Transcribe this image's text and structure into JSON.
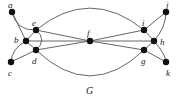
{
  "figure": {
    "caption": "G",
    "caption_position": {
      "x": 86,
      "y": 86
    },
    "width": 179,
    "height": 103,
    "background_color": "#ffffff",
    "edge_color": "#555555",
    "vertex_color": "#111111",
    "label_color": "#1a1a1a"
  },
  "graph": {
    "name": "G",
    "vertex_count": 11,
    "edge_count": 18,
    "vertices": [
      {
        "id": "a",
        "label": "a",
        "x": 12,
        "y": 12,
        "r": 3.2,
        "label_x": 8,
        "label_y": 1
      },
      {
        "id": "b",
        "label": "b",
        "x": 26,
        "y": 41,
        "r": 3.2,
        "label_x": 14,
        "label_y": 36
      },
      {
        "id": "c",
        "label": "c",
        "x": 11,
        "y": 62,
        "r": 3.2,
        "label_x": 8,
        "label_y": 69
      },
      {
        "id": "d",
        "label": "d",
        "x": 36,
        "y": 50,
        "r": 3.2,
        "label_x": 32,
        "label_y": 57
      },
      {
        "id": "e",
        "label": "e",
        "x": 36,
        "y": 30,
        "r": 3.2,
        "label_x": 32,
        "label_y": 19
      },
      {
        "id": "f",
        "label": "f",
        "x": 90,
        "y": 41,
        "r": 3.2,
        "label_x": 87,
        "label_y": 29
      },
      {
        "id": "g",
        "label": "g",
        "x": 144,
        "y": 50,
        "r": 3.2,
        "label_x": 141,
        "label_y": 57
      },
      {
        "id": "h",
        "label": "h",
        "x": 154,
        "y": 41,
        "r": 3.2,
        "label_x": 160,
        "label_y": 38
      },
      {
        "id": "i",
        "label": "i",
        "x": 144,
        "y": 30,
        "r": 3.2,
        "label_x": 142,
        "label_y": 19
      },
      {
        "id": "j",
        "label": "j",
        "x": 166,
        "y": 12,
        "r": 3.2,
        "label_x": 166,
        "label_y": 1
      },
      {
        "id": "k",
        "label": "k",
        "x": 166,
        "y": 62,
        "r": 3.2,
        "label_x": 166,
        "label_y": 69
      }
    ],
    "edges": [
      {
        "from": "a",
        "to": "b",
        "type": "line"
      },
      {
        "from": "a",
        "to": "e",
        "type": "curve",
        "curve_x": 20,
        "curve_y": 26
      },
      {
        "from": "b",
        "to": "c",
        "type": "curve",
        "curve_x": 15,
        "curve_y": 50
      },
      {
        "from": "b",
        "to": "e",
        "type": "line"
      },
      {
        "from": "b",
        "to": "d",
        "type": "line"
      },
      {
        "from": "c",
        "to": "d",
        "type": "line"
      },
      {
        "from": "e",
        "to": "d",
        "type": "curve",
        "curve_x": 42,
        "curve_y": 40
      },
      {
        "from": "e",
        "to": "f",
        "type": "line"
      },
      {
        "from": "d",
        "to": "f",
        "type": "line"
      },
      {
        "from": "e",
        "to": "i",
        "type": "curve",
        "curve_x": 90,
        "curve_y": 8
      },
      {
        "from": "d",
        "to": "g",
        "type": "curve",
        "curve_x": 90,
        "curve_y": 76
      },
      {
        "from": "f",
        "to": "i",
        "type": "line"
      },
      {
        "from": "f",
        "to": "g",
        "type": "line"
      },
      {
        "from": "f",
        "to": "h",
        "type": "line"
      },
      {
        "from": "b",
        "to": "f",
        "type": "line"
      },
      {
        "from": "i",
        "to": "h",
        "type": "line"
      },
      {
        "from": "g",
        "to": "h",
        "type": "line"
      },
      {
        "from": "i",
        "to": "j",
        "type": "line"
      },
      {
        "from": "g",
        "to": "k",
        "type": "line"
      },
      {
        "from": "h",
        "to": "j",
        "type": "curve",
        "curve_x": 163,
        "curve_y": 27
      },
      {
        "from": "h",
        "to": "k",
        "type": "curve",
        "curve_x": 163,
        "curve_y": 53
      }
    ]
  }
}
